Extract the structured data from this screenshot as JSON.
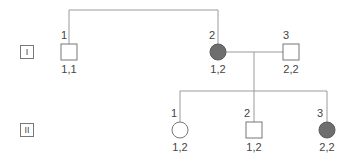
{
  "diagram": {
    "type": "pedigree",
    "colors": {
      "line": "#9a9a9a",
      "outline": "#777777",
      "affected_fill": "#6e6e6e",
      "unaffected_fill": "#ffffff",
      "text": "#444444"
    },
    "generations": [
      {
        "label": "I",
        "members": [
          {
            "id": "I-1",
            "number": "1",
            "sex": "male",
            "affected": false,
            "genotype": "1,1"
          },
          {
            "id": "I-2",
            "number": "2",
            "sex": "female",
            "affected": true,
            "genotype": "1,2"
          },
          {
            "id": "I-3",
            "number": "3",
            "sex": "male",
            "affected": false,
            "genotype": "2,2"
          }
        ]
      },
      {
        "label": "II",
        "members": [
          {
            "id": "II-1",
            "number": "1",
            "sex": "female",
            "affected": false,
            "genotype": "1,2"
          },
          {
            "id": "II-2",
            "number": "2",
            "sex": "male",
            "affected": false,
            "genotype": "1,2"
          },
          {
            "id": "II-3",
            "number": "3",
            "sex": "female",
            "affected": true,
            "genotype": "2,2"
          }
        ]
      }
    ]
  }
}
